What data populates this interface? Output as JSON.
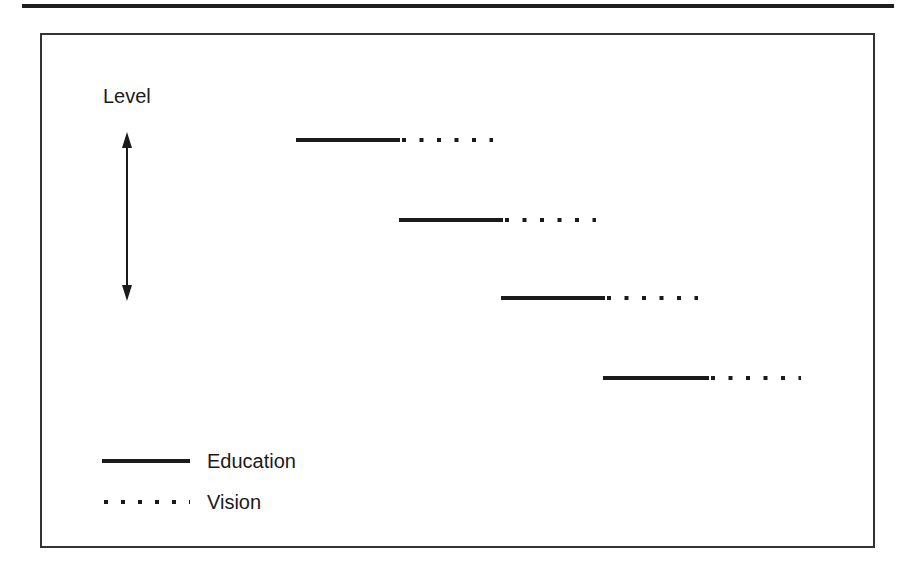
{
  "figure": {
    "axis_label": "Level",
    "legend": [
      {
        "label": "Education",
        "style": "solid"
      },
      {
        "label": "Vision",
        "style": "dotted"
      }
    ],
    "stages": [
      {
        "index": 1,
        "education": [
          296,
          400
        ],
        "vision": [
          400,
          493
        ],
        "y": 140
      },
      {
        "index": 2,
        "education": [
          399,
          503
        ],
        "vision": [
          503,
          596
        ],
        "y": 220
      },
      {
        "index": 3,
        "education": [
          501,
          605
        ],
        "vision": [
          605,
          698
        ],
        "y": 298
      },
      {
        "index": 4,
        "education": [
          603,
          709
        ],
        "vision": [
          709,
          801
        ],
        "y": 378
      }
    ],
    "colors": {
      "ink": "#1a1a1a",
      "frame": "#333333",
      "background": "#ffffff"
    }
  }
}
